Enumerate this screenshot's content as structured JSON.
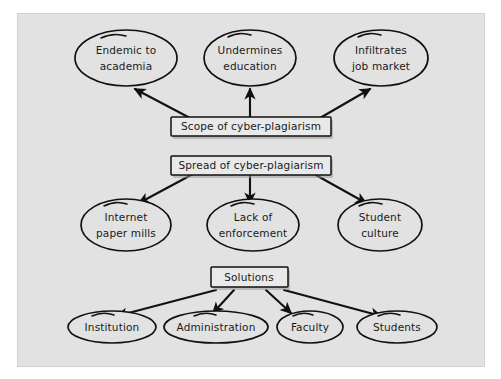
{
  "canvas": {
    "background_color": "#e2e2e2",
    "border_color": "#d2d2d2",
    "page_background": "#ffffff",
    "stroke_color": "#111111",
    "text_color": "#1a1a1a"
  },
  "diagram": {
    "type": "concept-map",
    "groups": [
      {
        "id": "scope",
        "hub_label": "Scope of cyber-plagiarism",
        "direction": "up",
        "children": [
          "Endemic to academia",
          "Undermines education",
          "Infiltrates job market"
        ]
      },
      {
        "id": "spread",
        "hub_label": "Spread of cyber-plagiarism",
        "direction": "down",
        "children": [
          "Internet paper mills",
          "Lack of enforcement",
          "Student culture"
        ]
      },
      {
        "id": "solutions",
        "hub_label": "Solutions",
        "direction": "down",
        "children": [
          "Institution",
          "Administration",
          "Faculty",
          "Students"
        ]
      }
    ]
  },
  "nodes": {
    "top_row": [
      {
        "id": "endemic",
        "line1": "Endemic to",
        "line2": "academia"
      },
      {
        "id": "undermines",
        "line1": "Undermines",
        "line2": "education"
      },
      {
        "id": "infiltrates",
        "line1": "Infiltrates",
        "line2": "job market"
      }
    ],
    "middle_row": [
      {
        "id": "paper-mills",
        "line1": "Internet",
        "line2": "paper mills"
      },
      {
        "id": "enforcement",
        "line1": "Lack of",
        "line2": "enforcement"
      },
      {
        "id": "student-culture",
        "line1": "Student",
        "line2": "culture"
      }
    ],
    "bottom_row": [
      {
        "id": "institution",
        "label": "Institution"
      },
      {
        "id": "administration",
        "label": "Administration"
      },
      {
        "id": "faculty",
        "label": "Faculty"
      },
      {
        "id": "students",
        "label": "Students"
      }
    ],
    "boxes": [
      {
        "id": "scope-box",
        "label": "Scope of cyber-plagiarism"
      },
      {
        "id": "spread-box",
        "label": "Spread of cyber-plagiarism"
      },
      {
        "id": "solutions-box",
        "label": "Solutions"
      }
    ]
  }
}
